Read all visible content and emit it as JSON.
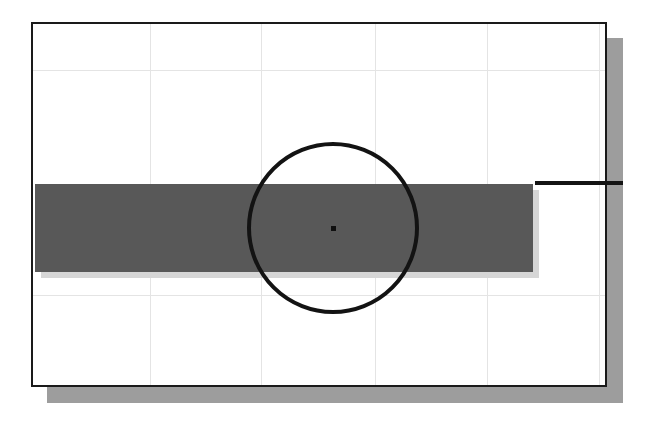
{
  "figure": {
    "title": "",
    "caption": "",
    "background_color": "#ffffff"
  },
  "frame": {
    "name": "plot-frame",
    "x": 31,
    "y": 22,
    "width": 576,
    "height": 365,
    "border_color": "#1a1a1a",
    "border_width": 2,
    "fill_color": "#ffffff",
    "shadow_color": "#9d9d9d",
    "shadow_offset_x": 16,
    "shadow_offset_y": 16
  },
  "grid": {
    "name": "grid",
    "visible": true,
    "color": "#e4e4e4",
    "line_width": 1,
    "horizontal_y": [
      46,
      271
    ],
    "vertical_x": [
      117,
      228,
      342,
      454,
      566
    ]
  },
  "chart_data": {
    "type": "diagram",
    "title": "",
    "subtitle": "",
    "xlabel": "",
    "ylabel": "",
    "xlim": [
      0,
      576
    ],
    "ylim": [
      0,
      365
    ],
    "grid": true,
    "legend": "none",
    "annotations": [],
    "shapes": [
      {
        "id": "grey-band",
        "kind": "rectangle",
        "label": "grey horizontal band",
        "x": 2,
        "y": 160,
        "width": 498,
        "height": 88,
        "fill": "#585858",
        "stroke": "none",
        "shadow": "#d6d6d6",
        "shadow_offset": 6
      },
      {
        "id": "right-rule",
        "kind": "line",
        "label": "black horizontal rule extending right of frame",
        "x1": 504,
        "y1": 159,
        "x2": 592,
        "y2": 159,
        "stroke": "#141414",
        "stroke_width": 4
      },
      {
        "id": "circle-outline",
        "kind": "circle",
        "label": "circle outline",
        "cx": 300,
        "cy": 204,
        "r": 86,
        "stroke": "#131313",
        "stroke_width": 4,
        "fill": "none"
      },
      {
        "id": "center-point",
        "kind": "point",
        "label": "circle centre marker",
        "cx": 300,
        "cy": 204,
        "size": 5,
        "fill": "#0f0f0f"
      }
    ]
  }
}
